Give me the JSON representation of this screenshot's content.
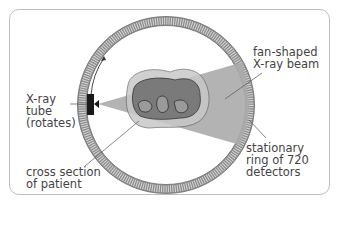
{
  "diagram": {
    "labels": {
      "beam": "fan-shaped\nX-ray beam",
      "tube": "X-ray\ntube\n(rotates)",
      "patient": "cross section\nof patient",
      "ring": "stationary\nring of 720\ndetectors"
    },
    "colors": {
      "ring": "#8a8a8a",
      "beam": "#a9a9a9",
      "patient_outer": "#c9c9c9",
      "patient_inner": "#7a7a7a",
      "tube": "#1a1a1a",
      "text": "#444444"
    },
    "detector_count": 720
  }
}
